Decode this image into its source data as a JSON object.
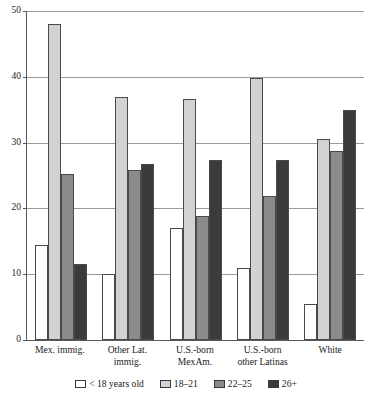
{
  "chart_data": {
    "type": "bar",
    "title": "",
    "subtitle": "",
    "xlabel": "",
    "ylabel": "",
    "ylim": [
      0,
      50
    ],
    "yticks": [
      0,
      10,
      20,
      30,
      40,
      50
    ],
    "ytick_labels": [
      "0",
      "10",
      "20",
      "30",
      "40",
      "50"
    ],
    "grid": "horizontal",
    "legend_position": "bottom",
    "categories": [
      "Mex. immig.",
      "Other Lat. immig.",
      "U.S.-born MexAm.",
      "U.S.-born other Latinas",
      "White"
    ],
    "category_lines": [
      [
        "Mex. immig.",
        ""
      ],
      [
        "Other Lat.",
        "immig."
      ],
      [
        "U.S.-born",
        "MexAm."
      ],
      [
        "U.S.-born",
        "other Latinas"
      ],
      [
        "White",
        ""
      ]
    ],
    "series": [
      {
        "name": "< 18 years old",
        "color": "#ffffff",
        "values": [
          14.5,
          10.0,
          17.0,
          10.9,
          5.5
        ]
      },
      {
        "name": "18–21",
        "color": "#d2d2d2",
        "values": [
          48.0,
          37.0,
          36.7,
          39.8,
          30.6
        ]
      },
      {
        "name": "22–25",
        "color": "#8b8b8b",
        "values": [
          25.2,
          25.8,
          18.8,
          21.9,
          28.7
        ]
      },
      {
        "name": "26+",
        "color": "#3b3b3b",
        "values": [
          11.6,
          26.8,
          27.3,
          27.3,
          35.0
        ]
      }
    ]
  },
  "legend": {
    "items": [
      {
        "label": "< 18 years old",
        "color": "#ffffff"
      },
      {
        "label": "18–21",
        "color": "#d2d2d2"
      },
      {
        "label": "22–25",
        "color": "#8b8b8b"
      },
      {
        "label": "26+",
        "color": "#3b3b3b"
      }
    ]
  },
  "axes": {
    "y_tick_labels": [
      "50",
      "40",
      "30",
      "20",
      "10",
      "0"
    ]
  }
}
